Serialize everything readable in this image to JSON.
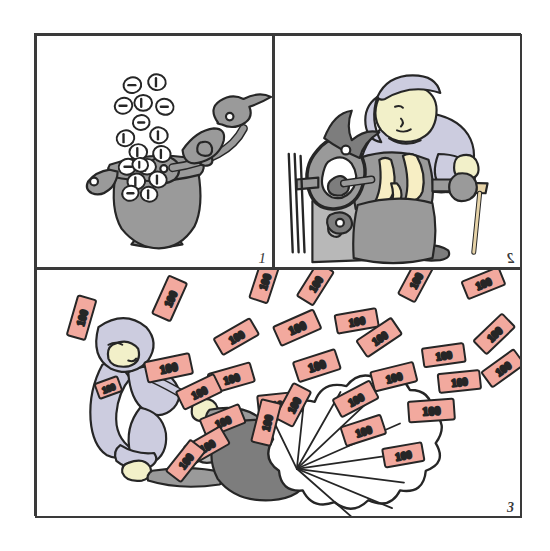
{
  "comic": {
    "title": "Three-panel illustration: coin minting, machine operation, and money blast",
    "style": {
      "ink": "#262626",
      "grey_metal": "#9a9a9a",
      "grey_dark": "#7d7d7d",
      "grey_light": "#b8b8b8",
      "lavender": "#ccccdf",
      "lavender_dark": "#b3b3cc",
      "skin": "#f2f0c9",
      "flame_yellow": "#f7eec4",
      "wood_tan": "#e6d3a8",
      "note_pink": "#f2a99e",
      "note_pink_light": "#f7c2b8",
      "paper_white": "#ffffff",
      "frame_line": "#3a3a3a"
    },
    "panels": [
      {
        "id": "panel-1",
        "number": "1",
        "caption_text": "",
        "scene": "coin press machine ejecting coins",
        "elements": {
          "machine_label": "coin-press-machine",
          "coin_face_marks": [
            "1",
            "0",
            "1",
            "0",
            "1",
            "0",
            "1",
            "1",
            "0",
            "1",
            "0",
            "1",
            "0",
            "1",
            "1",
            "0",
            "1",
            "0",
            "1",
            "0"
          ],
          "coin_count": 20
        }
      },
      {
        "id": "panel-2",
        "number": "2",
        "caption_text": "",
        "scene": "worker in cap operating a flaming hand-crank machine at a wooden stool",
        "elements": {
          "worker_label": "worker-with-cap",
          "machine_label": "hand-crank-furnace",
          "stool_label": "wooden-stool",
          "flame_label": "flames"
        }
      },
      {
        "id": "panel-3",
        "number": "3",
        "caption_text": "",
        "scene": "crouching worker fires a cannon that blasts a cloud of 100 banknotes",
        "elements": {
          "worker_label": "crouching-worker",
          "cannon_label": "money-cannon",
          "blast_label": "blast-cloud",
          "note_denomination": "100",
          "note_count": 30
        }
      }
    ]
  }
}
